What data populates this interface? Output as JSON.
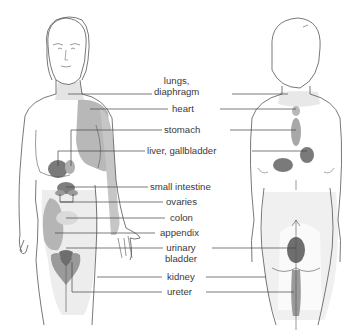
{
  "diagram": {
    "type": "referred-pain-body-map",
    "views": [
      "front",
      "back"
    ],
    "colors": {
      "outline": "#555555",
      "lightest": "#ececec",
      "light": "#c4c4c4",
      "medium": "#a8a8a8",
      "dark": "#7a7a7a",
      "leader": "#444444"
    },
    "labels": [
      {
        "id": "lungs",
        "line1": "lungs,",
        "line2": "diaphragm"
      },
      {
        "id": "heart",
        "line1": "heart"
      },
      {
        "id": "stomach",
        "line1": "stomach"
      },
      {
        "id": "liver",
        "line1": "liver, gallbladder"
      },
      {
        "id": "small_intestine",
        "line1": "small intestine"
      },
      {
        "id": "ovaries",
        "line1": "ovaries"
      },
      {
        "id": "colon",
        "line1": "colon"
      },
      {
        "id": "appendix",
        "line1": "appendix"
      },
      {
        "id": "urinary_bladder",
        "line1": "urinary",
        "line2": "bladder"
      },
      {
        "id": "kidney",
        "line1": "kidney"
      },
      {
        "id": "ureter",
        "line1": "ureter"
      }
    ]
  }
}
